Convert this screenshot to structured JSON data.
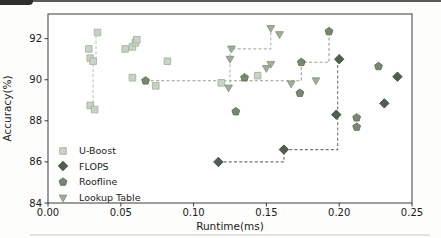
{
  "chart_data": {
    "type": "scatter",
    "title": "",
    "xlabel": "Runtime(ms)",
    "ylabel": "Accuracy(%)",
    "xlim": [
      0,
      0.25
    ],
    "ylim": [
      84,
      93.2
    ],
    "x_tick_values": [
      0.0,
      0.05,
      0.1,
      0.15,
      0.2,
      0.25
    ],
    "x_tick_labels": [
      "0.00",
      "0.05",
      "0.10",
      "0.15",
      "0.20",
      "0.25"
    ],
    "y_tick_values": [
      84,
      86,
      88,
      90,
      92
    ],
    "y_tick_labels": [
      "84",
      "86",
      "88",
      "90",
      "92"
    ],
    "grid": false,
    "legend_position": "lower-left",
    "series": [
      {
        "name": "U-Boost",
        "marker": "square",
        "color": "#c9d2c6",
        "edge": "#a6b2a2",
        "points": [
          [
            0.028,
            91.5
          ],
          [
            0.029,
            91.05
          ],
          [
            0.031,
            90.9
          ],
          [
            0.034,
            92.3
          ],
          [
            0.029,
            88.75
          ],
          [
            0.032,
            88.55
          ],
          [
            0.053,
            91.5
          ],
          [
            0.058,
            91.6
          ],
          [
            0.06,
            91.8
          ],
          [
            0.061,
            91.95
          ],
          [
            0.058,
            90.1
          ],
          [
            0.074,
            89.7
          ],
          [
            0.082,
            90.9
          ],
          [
            0.119,
            89.85
          ],
          [
            0.144,
            90.2
          ]
        ]
      },
      {
        "name": "FLOPS",
        "marker": "diamond",
        "color": "#515e51",
        "edge": "#404c41",
        "points": [
          [
            0.117,
            86.0
          ],
          [
            0.162,
            86.6
          ],
          [
            0.198,
            88.3
          ],
          [
            0.2,
            91.0
          ],
          [
            0.231,
            88.85
          ],
          [
            0.24,
            90.15
          ]
        ]
      },
      {
        "name": "Roofline",
        "marker": "pentagon",
        "color": "#78886f",
        "edge": "#5e6f56",
        "points": [
          [
            0.067,
            89.95
          ],
          [
            0.135,
            90.1
          ],
          [
            0.174,
            90.85
          ],
          [
            0.193,
            92.35
          ],
          [
            0.129,
            88.45
          ],
          [
            0.173,
            89.35
          ],
          [
            0.212,
            88.15
          ],
          [
            0.212,
            87.7
          ],
          [
            0.227,
            90.65
          ]
        ]
      },
      {
        "name": "Lookup Table",
        "marker": "triangle-down",
        "color": "#9fad99",
        "edge": "#879781",
        "points": [
          [
            0.126,
            91.5
          ],
          [
            0.125,
            91.0
          ],
          [
            0.124,
            89.6
          ],
          [
            0.15,
            90.55
          ],
          [
            0.153,
            90.75
          ],
          [
            0.153,
            92.5
          ],
          [
            0.159,
            92.2
          ],
          [
            0.167,
            89.8
          ],
          [
            0.184,
            89.95
          ]
        ]
      }
    ],
    "pareto_lines": [
      {
        "series": "U-Boost",
        "color": "#bdc7b9",
        "points": [
          [
            0.031,
            88.6
          ],
          [
            0.031,
            90.9
          ],
          [
            0.033,
            90.9
          ],
          [
            0.033,
            92.3
          ]
        ]
      },
      {
        "series": "FLOPS",
        "color": "#6d786d",
        "points": [
          [
            0.117,
            86.0
          ],
          [
            0.162,
            86.0
          ],
          [
            0.162,
            86.6
          ],
          [
            0.199,
            86.6
          ],
          [
            0.199,
            91.0
          ]
        ]
      },
      {
        "series": "Roofline",
        "color": "#94a18c",
        "points": [
          [
            0.067,
            89.95
          ],
          [
            0.174,
            89.95
          ],
          [
            0.174,
            90.85
          ],
          [
            0.193,
            90.85
          ],
          [
            0.193,
            92.35
          ]
        ]
      },
      {
        "series": "Lookup Table",
        "color": "#aab7a4",
        "points": [
          [
            0.125,
            89.6
          ],
          [
            0.125,
            91.5
          ],
          [
            0.153,
            91.5
          ],
          [
            0.153,
            92.5
          ]
        ]
      }
    ]
  }
}
